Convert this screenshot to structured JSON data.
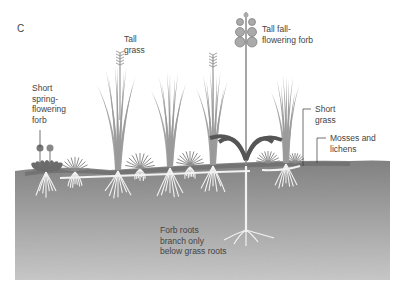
{
  "figure": {
    "panel_letter": "C"
  },
  "labels": {
    "short_spring_forb": "Short\nspring-\nflowering\nforb",
    "tall_grass": "Tall\ngrass",
    "tall_fall_forb": "Tall fall-\nflowering forb",
    "short_grass": "Short\ngrass",
    "mosses_lichens": "Mosses and\nlichens",
    "forb_roots": "Forb roots\nbranch only\nbelow grass roots"
  },
  "colors": {
    "label_text": "#444444",
    "grass": "#9a9a9a",
    "grass_dark": "#555555",
    "soil_top": "#7d7d7d",
    "soil_bottom": "#c9c9c9",
    "roots": "#f2f2f2",
    "leader_line": "#333333"
  }
}
